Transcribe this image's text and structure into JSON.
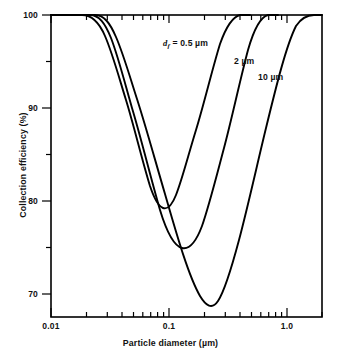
{
  "chart_data": {
    "type": "line",
    "title": "",
    "xlabel": "Particle diameter (µm)",
    "ylabel": "Collection efficiency (%)",
    "xscale": "log",
    "xlim": [
      0.01,
      2.0
    ],
    "ylim": [
      67.5,
      100
    ],
    "grid": false,
    "legend_position": "inline-annotations",
    "x_major_ticks": [
      0.01,
      0.1,
      1.0
    ],
    "x_major_tick_labels": [
      "0.01",
      "0.1",
      "1.0"
    ],
    "x_minor_ticks": [
      0.02,
      0.03,
      0.04,
      0.05,
      0.06,
      0.07,
      0.08,
      0.09,
      0.2,
      0.3,
      0.4,
      0.5,
      0.6,
      0.7,
      0.8,
      0.9,
      2.0
    ],
    "y_major_ticks": [
      70,
      80,
      90,
      100
    ],
    "y_major_tick_labels": [
      "70",
      "80",
      "90",
      "100"
    ],
    "y_minor_ticks": [
      75,
      85,
      95
    ],
    "series": [
      {
        "name": "df_0p5",
        "label_html": "<span class=\"ital\">d<sub>f</sub></span> = 0.5 µm",
        "label_text": "df = 0.5 µm",
        "fiber_diameter_um": 0.5,
        "min_efficiency_pct": 79.0,
        "min_at_particle_diameter_um": 0.13,
        "x": [
          0.01,
          0.015,
          0.02,
          0.025,
          0.03,
          0.04,
          0.05,
          0.065,
          0.08,
          0.1,
          0.115,
          0.13,
          0.15,
          0.17,
          0.2,
          0.24,
          0.29,
          0.35,
          0.42,
          0.5
        ],
        "y": [
          100.0,
          100.0,
          99.9,
          99.3,
          98.2,
          95.4,
          92.4,
          88.3,
          85.0,
          81.3,
          79.8,
          79.0,
          79.6,
          81.4,
          85.2,
          90.0,
          94.6,
          97.9,
          99.5,
          100.0
        ]
      },
      {
        "name": "df_2",
        "label_html": "2 µm",
        "label_text": "2 µm",
        "fiber_diameter_um": 2,
        "min_efficiency_pct": 74.8,
        "min_at_particle_diameter_um": 0.21,
        "x": [
          0.01,
          0.018,
          0.025,
          0.032,
          0.042,
          0.055,
          0.07,
          0.09,
          0.11,
          0.14,
          0.17,
          0.2,
          0.21,
          0.23,
          0.26,
          0.3,
          0.35,
          0.42,
          0.5,
          0.6,
          0.7
        ],
        "y": [
          100.0,
          100.0,
          99.7,
          98.8,
          96.9,
          94.0,
          90.8,
          87.0,
          83.9,
          80.0,
          76.9,
          75.1,
          74.8,
          75.4,
          77.6,
          81.6,
          87.0,
          93.0,
          97.0,
          99.4,
          100.0
        ]
      },
      {
        "name": "df_10",
        "label_html": "10 µm",
        "label_text": "10 µm",
        "fiber_diameter_um": 10,
        "min_efficiency_pct": 69.3,
        "min_at_particle_diameter_um": 0.37,
        "x": [
          0.01,
          0.022,
          0.03,
          0.04,
          0.055,
          0.075,
          0.1,
          0.13,
          0.17,
          0.22,
          0.28,
          0.34,
          0.37,
          0.42,
          0.5,
          0.6,
          0.75,
          0.9,
          1.1,
          1.4,
          1.8,
          2.0
        ],
        "y": [
          100.0,
          100.0,
          99.8,
          99.2,
          97.8,
          95.6,
          92.8,
          89.8,
          86.2,
          82.2,
          77.0,
          70.9,
          69.3,
          70.2,
          73.6,
          78.8,
          87.0,
          92.6,
          96.6,
          99.2,
          100.0,
          100.0
        ]
      }
    ]
  },
  "axes": {
    "x_title": "Particle diameter (µm)",
    "y_title": "Collection efficiency (%)",
    "x_labels": [
      "0.01",
      "0.1",
      "1.0"
    ],
    "y_labels": [
      "100",
      "90",
      "80",
      "70"
    ]
  },
  "colors": {
    "curve": "#000000",
    "axis": "#000000",
    "background": "#ffffff",
    "text": "#111111"
  }
}
